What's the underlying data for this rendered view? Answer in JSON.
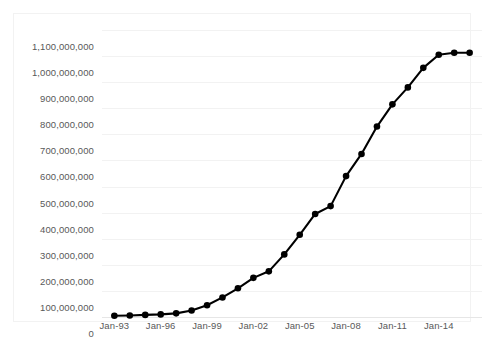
{
  "chart_data": {
    "type": "line",
    "title": "",
    "subtitle": "",
    "xlabel": "",
    "ylabel": "",
    "grid": true,
    "legend": false,
    "legend_position": "none",
    "marker": "filled-circle",
    "line_color": "#000000",
    "marker_color": "#000000",
    "grid_color": "#F2F2F2",
    "tick_label_color": "#595959",
    "background_color": "#FFFFFF",
    "ylim": [
      0,
      1100000000
    ],
    "ytick_values": [
      0,
      100000000,
      200000000,
      300000000,
      400000000,
      500000000,
      600000000,
      700000000,
      800000000,
      900000000,
      1000000000,
      1100000000
    ],
    "ytick_labels": [
      "0",
      "100,000,000",
      "200,000,000",
      "300,000,000",
      "400,000,000",
      "500,000,000",
      "600,000,000",
      "700,000,000",
      "800,000,000",
      "900,000,000",
      "1,000,000,000",
      "1,100,000,000"
    ],
    "xtick_labels": [
      "Jan-93",
      "Jan-96",
      "Jan-99",
      "Jan-02",
      "Jan-05",
      "Jan-08",
      "Jan-11",
      "Jan-14"
    ],
    "xtick_x": [
      1993,
      1996,
      1999,
      2002,
      2005,
      2008,
      2011,
      2014
    ],
    "xlim": [
      1992.2,
      2016.8
    ],
    "x": [
      1993,
      1994,
      1995,
      1996,
      1997,
      1998,
      1999,
      2000,
      2001,
      2002,
      2003,
      2004,
      2005,
      2006,
      2007,
      2008,
      2009,
      2010,
      2011,
      2012,
      2013,
      2014,
      2015,
      2016
    ],
    "categories": [
      "Jan-93",
      "Jan-94",
      "Jan-95",
      "Jan-96",
      "Jan-97",
      "Jan-98",
      "Jan-99",
      "Jan-00",
      "Jan-01",
      "Jan-02",
      "Jan-03",
      "Jan-04",
      "Jan-05",
      "Jan-06",
      "Jan-07",
      "Jan-08",
      "Jan-09",
      "Jan-10",
      "Jan-11",
      "Jan-12",
      "Jan-13",
      "Jan-14",
      "Jan-15",
      "Jan-16"
    ],
    "values": [
      5000000,
      6000000,
      8000000,
      10000000,
      14000000,
      25000000,
      45000000,
      75000000,
      110000000,
      150000000,
      175000000,
      240000000,
      315000000,
      395000000,
      425000000,
      540000000,
      625000000,
      730000000,
      815000000,
      880000000,
      955000000,
      1005000000,
      1013000000,
      1013000000
    ],
    "series": [
      {
        "name": "",
        "values": [
          5000000,
          6000000,
          8000000,
          10000000,
          14000000,
          25000000,
          45000000,
          75000000,
          110000000,
          150000000,
          175000000,
          240000000,
          315000000,
          395000000,
          425000000,
          540000000,
          625000000,
          730000000,
          815000000,
          880000000,
          955000000,
          1005000000,
          1013000000,
          1013000000
        ]
      }
    ]
  }
}
